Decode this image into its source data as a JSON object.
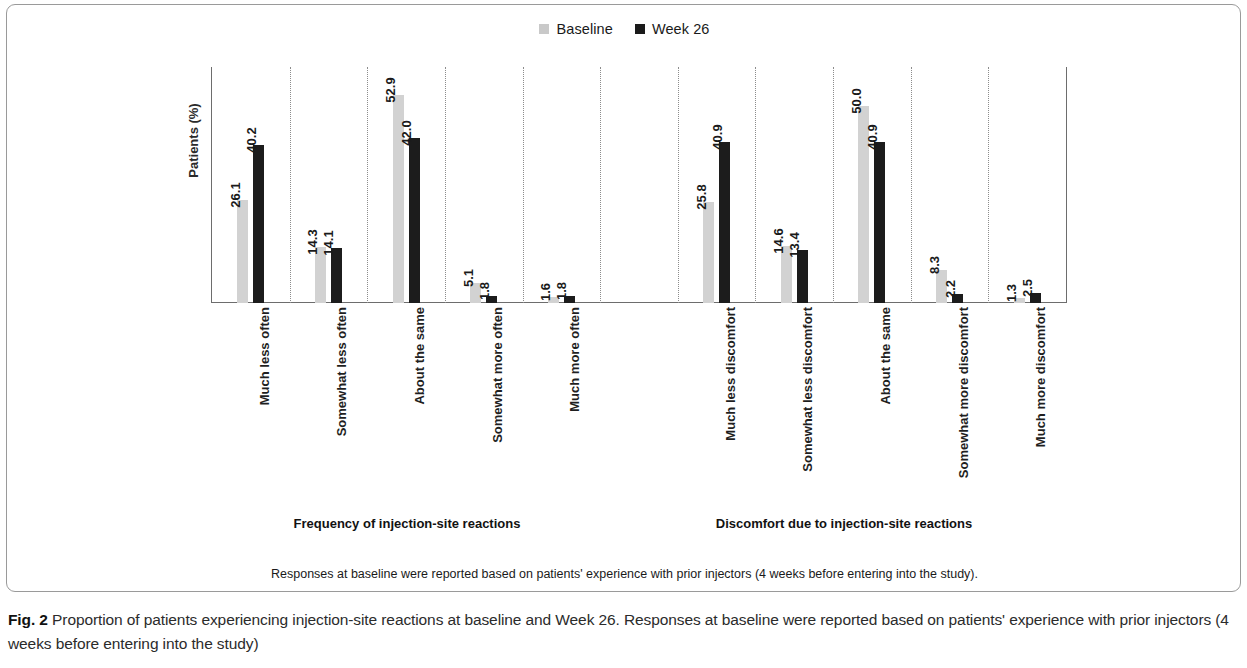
{
  "figure": {
    "label": "Fig. 2",
    "caption": " Proportion of patients experiencing injection-site reactions at baseline and Week 26. Responses at baseline were reported based on patients' experience with prior injectors (4 weeks before entering into the study)",
    "footnote": "Responses at baseline were reported based on patients' experience with prior injectors (4 weeks before entering into the study)."
  },
  "legend": {
    "items": [
      {
        "label": "Baseline",
        "color": "#c9c9c9",
        "key": "baseline"
      },
      {
        "label": "Week 26",
        "color": "#1a1a1a",
        "key": "week26"
      }
    ]
  },
  "axis": {
    "y_title": "Patients (%)"
  },
  "groups": [
    {
      "title": "Frequency of injection-site reactions"
    },
    {
      "title": "Discomfort due to injection-site reactions"
    }
  ],
  "chart_data": {
    "type": "bar",
    "title": "Proportion of patients experiencing injection-site reactions at baseline and Week 26",
    "xlabel": "",
    "ylabel": "Patients (%)",
    "ylim": [
      0,
      60
    ],
    "grid": false,
    "legend_position": "top-center",
    "groups": [
      {
        "name": "Frequency of injection-site reactions",
        "categories": [
          "Much less often",
          "Somewhat less often",
          "About the same",
          "Somewhat more often",
          "Much more often"
        ],
        "series": [
          {
            "name": "Baseline",
            "values": [
              26.1,
              14.3,
              52.9,
              5.1,
              1.6
            ]
          },
          {
            "name": "Week 26",
            "values": [
              40.2,
              14.1,
              42.0,
              1.8,
              1.8
            ]
          }
        ]
      },
      {
        "name": "Discomfort due to injection-site reactions",
        "categories": [
          "Much less discomfort",
          "Somewhat less discomfort",
          "About the same",
          "Somewhat more discomfort",
          "Much more discomfort"
        ],
        "series": [
          {
            "name": "Baseline",
            "values": [
              25.8,
              14.6,
              50.0,
              8.3,
              1.3
            ]
          },
          {
            "name": "Week 26",
            "values": [
              40.9,
              13.4,
              40.9,
              2.2,
              2.5
            ]
          }
        ]
      }
    ]
  },
  "slots": [
    {
      "kind": "data",
      "group": 0,
      "index": 0,
      "label": "Much less often",
      "baseline": "26.1",
      "week26": "40.2"
    },
    {
      "kind": "data",
      "group": 0,
      "index": 1,
      "label": "Somewhat less often",
      "baseline": "14.3",
      "week26": "14.1"
    },
    {
      "kind": "data",
      "group": 0,
      "index": 2,
      "label": "About the same",
      "baseline": "52.9",
      "week26": "42.0"
    },
    {
      "kind": "data",
      "group": 0,
      "index": 3,
      "label": "Somewhat more often",
      "baseline": "5.1",
      "week26": "1.8"
    },
    {
      "kind": "data",
      "group": 0,
      "index": 4,
      "label": "Much more often",
      "baseline": "1.6",
      "week26": "1.8"
    },
    {
      "kind": "gap",
      "group": null,
      "index": null,
      "label": "",
      "baseline": null,
      "week26": null
    },
    {
      "kind": "data",
      "group": 1,
      "index": 0,
      "label": "Much less discomfort",
      "baseline": "25.8",
      "week26": "40.9"
    },
    {
      "kind": "data",
      "group": 1,
      "index": 1,
      "label": "Somewhat less discomfort",
      "baseline": "14.6",
      "week26": "13.4"
    },
    {
      "kind": "data",
      "group": 1,
      "index": 2,
      "label": "About the same",
      "baseline": "50.0",
      "week26": "40.9"
    },
    {
      "kind": "data",
      "group": 1,
      "index": 3,
      "label": "Somewhat more discomfort",
      "baseline": "8.3",
      "week26": "2.2"
    },
    {
      "kind": "data",
      "group": 1,
      "index": 4,
      "label": "Much more discomfort",
      "baseline": "1.3",
      "week26": "2.5"
    }
  ]
}
